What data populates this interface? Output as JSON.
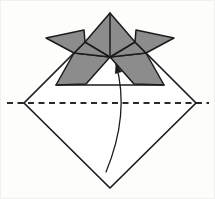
{
  "figure": {
    "kind": "origami-instruction-step",
    "text_labels": []
  },
  "colors": {
    "paper": "#ffffff",
    "shade": "#8c8c8c",
    "line": "#1b1b1b",
    "fold_dash": "#2a2a2a"
  },
  "canvas": {
    "width": 215,
    "height": 199
  },
  "diamond": {
    "left": [
      24,
      103
    ],
    "right": [
      196,
      103
    ],
    "bottom": [
      110,
      188
    ],
    "top": [
      110,
      18
    ]
  },
  "fold_line": {
    "y": 103,
    "x1": 7,
    "x2": 209,
    "dash": [
      6,
      4.5
    ],
    "width": 2
  },
  "helmet": {
    "peak": [
      110,
      13
    ],
    "apex": [
      110,
      57
    ],
    "kite": [
      [
        110,
        13
      ],
      [
        135,
        42
      ],
      [
        110,
        57
      ],
      [
        85,
        42
      ]
    ],
    "horn_left": [
      [
        46,
        38
      ],
      [
        84,
        30
      ],
      [
        85,
        42
      ],
      [
        74,
        53
      ]
    ],
    "horn_right": [
      [
        174,
        38
      ],
      [
        136,
        30
      ],
      [
        135,
        42
      ],
      [
        146,
        53
      ]
    ],
    "wing_left": [
      [
        85,
        42
      ],
      [
        110,
        57
      ],
      [
        74,
        53
      ]
    ],
    "wing_right": [
      [
        135,
        42
      ],
      [
        110,
        57
      ],
      [
        146,
        53
      ]
    ],
    "flap_left": [
      [
        74,
        53
      ],
      [
        110,
        57
      ],
      [
        86,
        84
      ],
      [
        56,
        85
      ]
    ],
    "flap_right": [
      [
        146,
        53
      ],
      [
        110,
        57
      ],
      [
        134,
        84
      ],
      [
        164,
        85
      ]
    ],
    "baseline": [
      [
        56,
        85
      ],
      [
        164,
        85
      ]
    ],
    "center_crease": [
      [
        110,
        13
      ],
      [
        110,
        57
      ]
    ]
  },
  "diamond_edges": {
    "lower": [
      [
        24,
        103
      ],
      [
        110,
        188
      ],
      [
        196,
        103
      ]
    ],
    "upper_left_stub": [
      [
        24,
        103
      ],
      [
        74,
        53
      ]
    ],
    "upper_right_stub": [
      [
        196,
        103
      ],
      [
        146,
        53
      ]
    ]
  },
  "arrow": {
    "tail": [
      106,
      172
    ],
    "control": [
      130,
      114
    ],
    "head": [
      116,
      64
    ],
    "head_length": 9,
    "head_half_width": 3.4,
    "stroke_width": 1.3
  },
  "stroke_widths": {
    "outline": 1.7,
    "inner": 1.5
  }
}
